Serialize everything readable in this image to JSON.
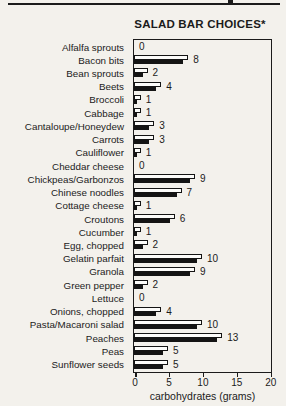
{
  "page": {
    "paper_color": "#f3f1ec",
    "ink_color": "#1b1b1b"
  },
  "chart_data": {
    "type": "bar",
    "orientation": "horizontal",
    "title": "SALAD BAR CHOICES*",
    "xlabel": "carbohydrates (grams)",
    "xlim": [
      0,
      20
    ],
    "x_ticks": [
      0,
      5,
      10,
      15,
      20
    ],
    "grid": false,
    "legend": "none",
    "bar_style": {
      "fill": "#fcfcfa",
      "outline": "#141414",
      "shadow": "#141414"
    },
    "categories": [
      "Alfalfa sprouts",
      "Bacon bits",
      "Bean sprouts",
      "Beets",
      "Broccoli",
      "Cabbage",
      "Cantaloupe/Honeydew",
      "Carrots",
      "Cauliflower",
      "Cheddar cheese",
      "Chickpeas/Garbonzos",
      "Chinese noodles",
      "Cottage cheese",
      "Croutons",
      "Cucumber",
      "Egg, chopped",
      "Gelatin parfait",
      "Granola",
      "Green pepper",
      "Lettuce",
      "Onions, chopped",
      "Pasta/Macaroni salad",
      "Peaches",
      "Peas",
      "Sunflower seeds"
    ],
    "values": [
      0,
      8,
      2,
      4,
      1,
      1,
      3,
      3,
      1,
      0,
      9,
      7,
      1,
      6,
      1,
      2,
      10,
      9,
      2,
      0,
      4,
      10,
      13,
      5,
      5
    ]
  }
}
